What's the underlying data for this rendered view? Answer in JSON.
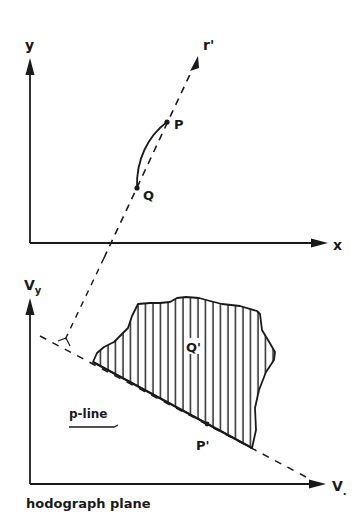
{
  "diagram": {
    "type": "physics-diagram",
    "top_panel": {
      "axis_x_label": "x",
      "axis_y_label": "y",
      "ray_label": "r'",
      "point_p_label": "P",
      "point_q_label": "Q"
    },
    "bottom_panel": {
      "axis_x_label": "V",
      "axis_x_suffix": ".",
      "axis_y_label": "V",
      "axis_y_subscript": "y",
      "region_label": "Q'",
      "point_label": "P'",
      "line_label": "p-line",
      "caption": "hodograph plane"
    },
    "colors": {
      "ink": "#1a1a1a",
      "background": "#ffffff"
    }
  }
}
